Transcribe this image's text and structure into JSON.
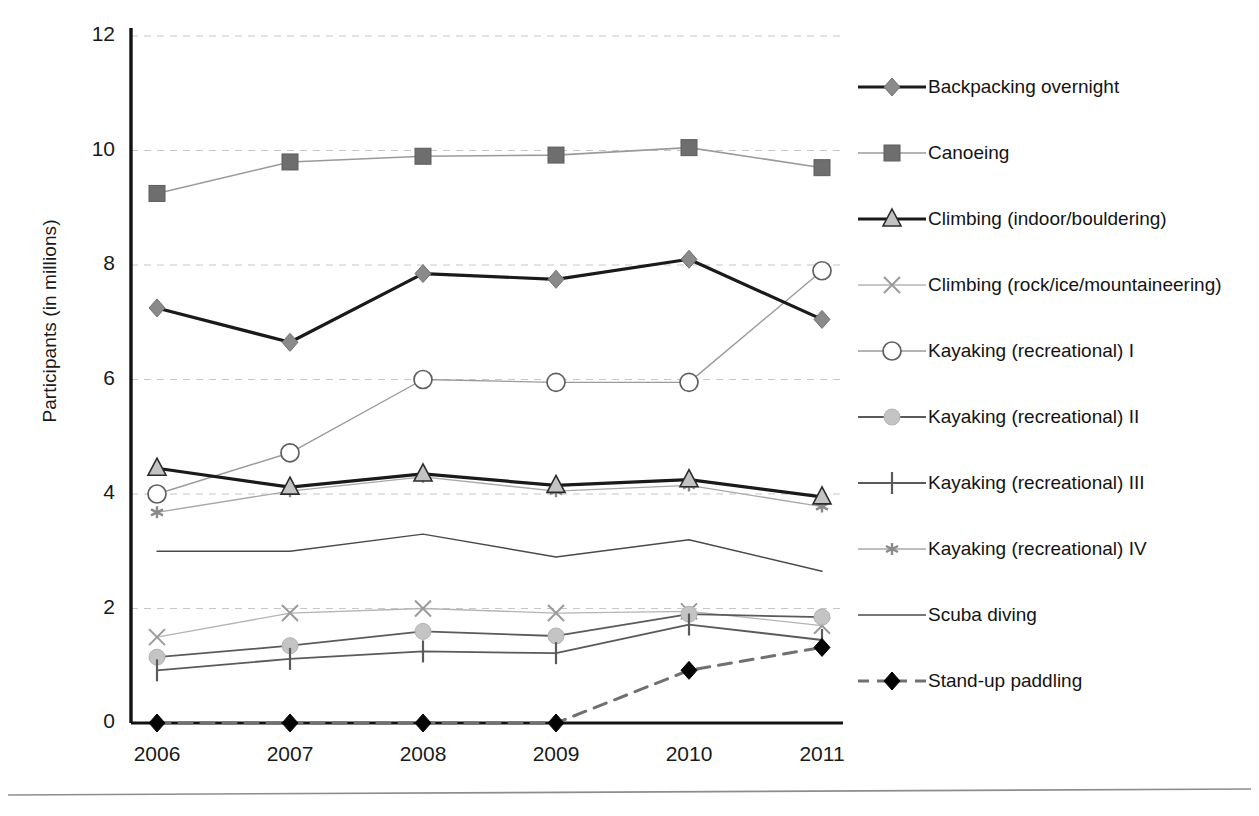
{
  "chart_data": {
    "type": "line",
    "title": "",
    "xlabel": "",
    "ylabel": "Participants (in millions)",
    "categories": [
      "2006",
      "2007",
      "2008",
      "2009",
      "2010",
      "2011"
    ],
    "x": [
      2006,
      2007,
      2008,
      2009,
      2010,
      2011
    ],
    "ylim": [
      0,
      12
    ],
    "yticks": [
      "0",
      "2",
      "4",
      "6",
      "8",
      "10",
      "12"
    ],
    "ytick_values": [
      0,
      2,
      4,
      6,
      8,
      10,
      12
    ],
    "grid": "horizontal dashed gridlines at every y tick",
    "legend_position": "right",
    "series": [
      {
        "name": "Backpacking overnight",
        "marker": "diamond-filled",
        "color": "#8a8a8a",
        "line_color": "#1a1a1a",
        "line_style": "solid",
        "line_width": 3.2,
        "values": [
          7.25,
          6.65,
          7.85,
          7.75,
          8.1,
          7.05
        ]
      },
      {
        "name": "Canoeing",
        "marker": "square-filled",
        "color": "#6e6e6e",
        "line_color": "#9a9a9a",
        "line_style": "solid",
        "line_width": 1.6,
        "values": [
          9.25,
          9.8,
          9.9,
          9.92,
          10.05,
          9.7
        ]
      },
      {
        "name": "Climbing (indoor/bouldering)",
        "marker": "triangle-open",
        "color": "#b0b0b0",
        "line_color": "#1a1a1a",
        "line_style": "solid",
        "line_width": 3.2,
        "values": [
          4.45,
          4.12,
          4.35,
          4.15,
          4.25,
          3.95
        ]
      },
      {
        "name": "Climbing (rock/ice/mountaineering)",
        "marker": "cross-x",
        "color": "#9a9a9a",
        "line_color": "#b4b4b4",
        "line_style": "solid",
        "line_width": 1.3,
        "values": [
          1.5,
          1.92,
          2.0,
          1.92,
          1.95,
          1.7
        ]
      },
      {
        "name": "Kayaking (recreational) I",
        "marker": "circle-open",
        "color": "#6a6a6a",
        "line_color": "#9a9a9a",
        "line_style": "solid",
        "line_width": 1.4,
        "values": [
          4.0,
          4.72,
          6.0,
          5.95,
          5.95,
          7.9
        ]
      },
      {
        "name": "Kayaking (recreational) II",
        "marker": "circle-filled",
        "color": "#c4c4c4",
        "line_color": "#5a5a5a",
        "line_style": "solid",
        "line_width": 1.8,
        "values": [
          1.15,
          1.35,
          1.6,
          1.52,
          1.9,
          1.85
        ]
      },
      {
        "name": "Kayaking (recreational) III",
        "marker": "plus-tick",
        "color": "#6a6a6a",
        "line_color": "#5a5a5a",
        "line_style": "solid",
        "line_width": 1.8,
        "values": [
          0.92,
          1.12,
          1.25,
          1.22,
          1.72,
          1.45
        ]
      },
      {
        "name": "Kayaking (recreational) IV",
        "marker": "star-small",
        "color": "#8a8a8a",
        "line_color": "#a8a8a8",
        "line_style": "solid",
        "line_width": 1.4,
        "values": [
          3.68,
          4.05,
          4.3,
          4.05,
          4.15,
          3.78
        ]
      },
      {
        "name": "Scuba diving",
        "marker": "none",
        "color": "#4a4a4a",
        "line_color": "#4a4a4a",
        "line_style": "solid",
        "line_width": 1.4,
        "values": [
          3.0,
          3.0,
          3.3,
          2.9,
          3.2,
          2.65
        ]
      },
      {
        "name": "Stand-up paddling",
        "marker": "diamond-black",
        "color": "#000000",
        "line_color": "#707070",
        "line_style": "dashed",
        "line_width": 3.0,
        "values": [
          0.0,
          0.0,
          0.0,
          0.0,
          0.92,
          1.32
        ]
      }
    ]
  },
  "axes": {
    "ylabel": "Participants (in millions)",
    "yticks": [
      "12",
      "10",
      "8",
      "6",
      "4",
      "2",
      "0"
    ],
    "xticks": [
      "2006",
      "2007",
      "2008",
      "2009",
      "2010",
      "2011"
    ]
  },
  "legend": {
    "items": [
      {
        "label": "Backpacking overnight",
        "marker": "diamond-filled"
      },
      {
        "label": "Canoeing",
        "marker": "square-filled"
      },
      {
        "label": "Climbing (indoor/bouldering)",
        "marker": "triangle-open"
      },
      {
        "label": "Climbing (rock/ice/mountaineering)",
        "marker": "cross-x"
      },
      {
        "label": "Kayaking (recreational) I",
        "marker": "circle-open"
      },
      {
        "label": "Kayaking (recreational) II",
        "marker": "circle-filled"
      },
      {
        "label": "Kayaking (recreational) III",
        "marker": "plus-tick"
      },
      {
        "label": "Kayaking (recreational) IV",
        "marker": "star-small"
      },
      {
        "label": "Scuba diving",
        "marker": "none"
      },
      {
        "label": "Stand-up paddling",
        "marker": "diamond-black"
      }
    ]
  }
}
